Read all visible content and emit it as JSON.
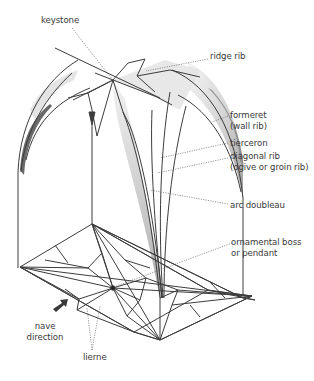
{
  "diagram": {
    "labels": {
      "keystone": "keystone",
      "ridge_rib": "ridge rib",
      "formeret_1": "formeret",
      "formeret_2": "(wall rib)",
      "tierceron": "tierceron",
      "diagonal_rib_1": "diagonal rib",
      "diagonal_rib_2": "(ogive or groin rib)",
      "arc_doubleau": "arc doubleau",
      "boss_1": "ornamental boss",
      "boss_2": "or pendant",
      "nave_1": "nave",
      "nave_2": "direction",
      "lierne": "lierne"
    },
    "colors": {
      "line": "#3c3c3c",
      "leader": "#555555",
      "shade": "#bdbdbd",
      "text": "#3a3a3a"
    }
  }
}
